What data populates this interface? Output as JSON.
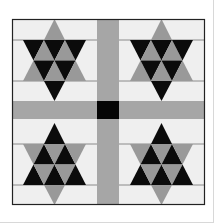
{
  "image": {
    "subject": "Quilt block pattern with four six-pointed stars",
    "colors": {
      "background": "#ffffff",
      "block_fill": "#efefef",
      "sashing": "#a6a6a6",
      "triangle_gray": "#999999",
      "triangle_black": "#0b0b0b",
      "center_square": "#050505",
      "border": "#222222",
      "seam_line": "#8a8a8a",
      "page_edge": "#d8d8d8"
    },
    "quilt": {
      "x": 12,
      "y": 19,
      "right": 205,
      "bottom": 205
    },
    "sashing": {
      "vertical": {
        "x1": 97,
        "x2": 119
      },
      "horizontal": {
        "y1": 101,
        "y2": 119
      }
    },
    "blocks": [
      {
        "name": "star-block-top-left",
        "x1": 12,
        "x2": 97,
        "y1": 19,
        "y2": 101,
        "cx": 54.5,
        "apex": 19,
        "rows": [
          19,
          40,
          60.5,
          81,
          101
        ],
        "orientation": "down"
      },
      {
        "name": "star-block-top-right",
        "x1": 119,
        "x2": 205,
        "y1": 19,
        "y2": 101,
        "cx": 161.5,
        "apex": 19,
        "rows": [
          19,
          40,
          60.5,
          81,
          101
        ],
        "orientation": "down"
      },
      {
        "name": "star-block-bottom-left",
        "x1": 12,
        "x2": 97,
        "y1": 119,
        "y2": 205,
        "cx": 54.5,
        "apex": 123,
        "rows": [
          123,
          144,
          164.5,
          185,
          205
        ],
        "orientation": "up"
      },
      {
        "name": "star-block-bottom-right",
        "x1": 119,
        "x2": 205,
        "y1": 119,
        "y2": 205,
        "cx": 161.5,
        "apex": 123,
        "rows": [
          123,
          144,
          164.5,
          185,
          205
        ],
        "orientation": "up"
      }
    ],
    "triangle_width": 21
  }
}
